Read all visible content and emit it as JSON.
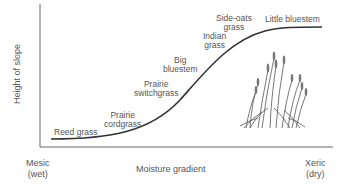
{
  "diagram": {
    "y_axis_label": "Height of slope",
    "x_axis_label": "Moisture gradient",
    "x_left": {
      "line1": "Mesic",
      "line2": "(wet)"
    },
    "x_right": {
      "line1": "Xeric",
      "line2": "(dry)"
    },
    "species": [
      {
        "name_line1": "Reed grass",
        "name_line2": ""
      },
      {
        "name_line1": "Prairie",
        "name_line2": "cordgrass"
      },
      {
        "name_line1": "Prairie",
        "name_line2": "switchgrass"
      },
      {
        "name_line1": "Big",
        "name_line2": "bluestem"
      },
      {
        "name_line1": "Indian",
        "name_line2": "grass"
      },
      {
        "name_line1": "Side-oats",
        "name_line2": "grass"
      },
      {
        "name_line1": "Little bluestem",
        "name_line2": ""
      }
    ],
    "illustration": "grass-clump-illustration",
    "colors": {
      "line": "#333333",
      "axis": "#666666",
      "text": "#555555"
    }
  }
}
